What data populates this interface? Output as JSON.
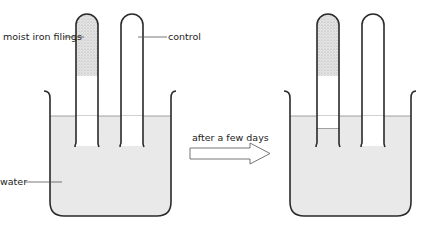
{
  "diagram": {
    "labels": {
      "iron_filings": "moist iron filings",
      "control": "control",
      "water": "water",
      "arrow": "after a few days"
    },
    "colors": {
      "water": "#e9e9e9",
      "filings": "#dcdcdc",
      "outline": "#2a2a2a",
      "leader": "#555555"
    },
    "panels": [
      {
        "name": "before",
        "tubes": [
          {
            "name": "iron-filings-tube",
            "filings": true,
            "water_inside": false
          },
          {
            "name": "control-tube",
            "filings": false,
            "water_inside": false
          }
        ]
      },
      {
        "name": "after",
        "tubes": [
          {
            "name": "iron-filings-tube",
            "filings": true,
            "water_inside": true
          },
          {
            "name": "control-tube",
            "filings": false,
            "water_inside": false
          }
        ]
      }
    ]
  }
}
